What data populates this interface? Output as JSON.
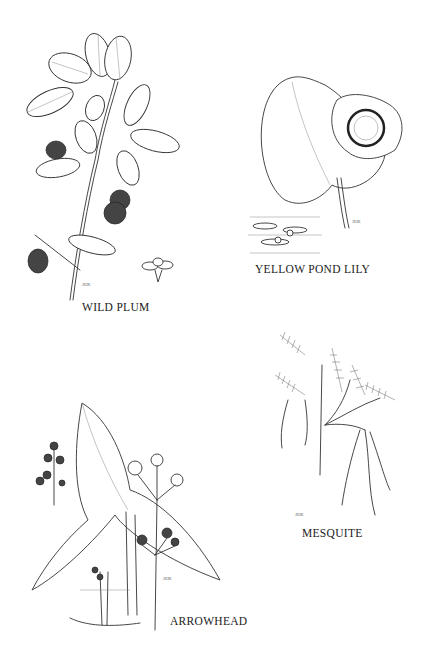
{
  "plates": [
    {
      "id": "wild-plum",
      "label": "WILD PLUM",
      "signature": "JEK"
    },
    {
      "id": "yellow-pond-lily",
      "label": "YELLOW POND LILY",
      "signature": "JEK"
    },
    {
      "id": "mesquite",
      "label": "MESQUITE",
      "signature": "JEK"
    },
    {
      "id": "arrowhead",
      "label": "ARROWHEAD",
      "signature": "JEK"
    }
  ]
}
